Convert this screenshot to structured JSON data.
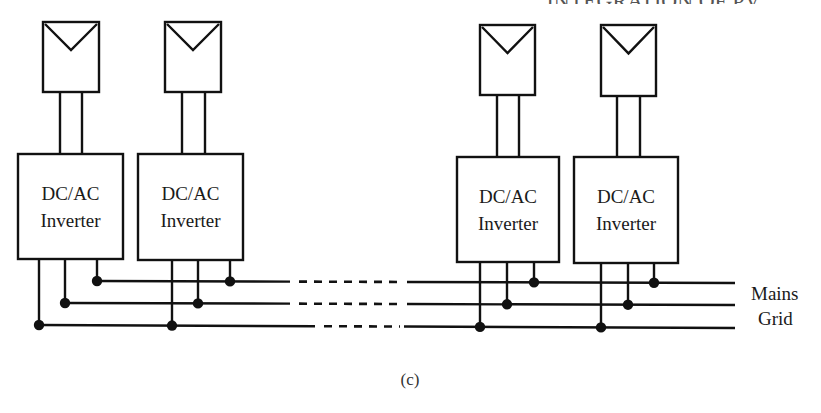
{
  "colors": {
    "stroke": "#111111",
    "background": "#ffffff",
    "text": "#1a1a1a"
  },
  "units": [
    {
      "id": "unit-1",
      "pv": {
        "x": 43,
        "y": 22,
        "w": 56,
        "h": 70
      },
      "leads": [
        60,
        82
      ],
      "inverter": {
        "x": 18,
        "y": 154,
        "w": 105,
        "h": 105,
        "line1": "DC/AC",
        "line2": "Inverter"
      },
      "drops": [
        39,
        65,
        97
      ]
    },
    {
      "id": "unit-2",
      "pv": {
        "x": 165,
        "y": 22,
        "w": 56,
        "h": 70
      },
      "leads": [
        182,
        205
      ],
      "inverter": {
        "x": 138,
        "y": 154,
        "w": 105,
        "h": 106,
        "line1": "DC/AC",
        "line2": "Inverter"
      },
      "drops": [
        172,
        198,
        230
      ]
    },
    {
      "id": "unit-3",
      "pv": {
        "x": 480,
        "y": 25,
        "w": 55,
        "h": 70
      },
      "leads": [
        497,
        519
      ],
      "inverter": {
        "x": 457,
        "y": 157,
        "w": 102,
        "h": 105,
        "line1": "DC/AC",
        "line2": "Inverter"
      },
      "drops": [
        480,
        507,
        534
      ]
    },
    {
      "id": "unit-4",
      "pv": {
        "x": 601,
        "y": 25,
        "w": 55,
        "h": 71
      },
      "leads": [
        617,
        640
      ],
      "inverter": {
        "x": 574,
        "y": 157,
        "w": 104,
        "h": 106,
        "line1": "DC/AC",
        "line2": "Inverter"
      },
      "drops": [
        601,
        628,
        654
      ]
    }
  ],
  "bus": [
    {
      "name": "phase-1",
      "y_left": 281,
      "y_right": 283,
      "x_start": 97,
      "solid_end": 290,
      "dash_end": 407,
      "x_end": 735,
      "drop_index": 2
    },
    {
      "name": "phase-2",
      "y_left": 303,
      "y_right": 305,
      "x_start": 65,
      "solid_end": 290,
      "dash_end": 407,
      "x_end": 735,
      "drop_index": 1
    },
    {
      "name": "phase-3",
      "y_left": 325,
      "y_right": 328,
      "x_start": 39,
      "solid_end": 315,
      "dash_end": 404,
      "x_end": 735,
      "drop_index": 0
    }
  ],
  "grid_label": {
    "line1": "Mains",
    "line2": "Grid"
  },
  "caption": "(c)",
  "header_fragment": "...INTEGRATION OF PV"
}
